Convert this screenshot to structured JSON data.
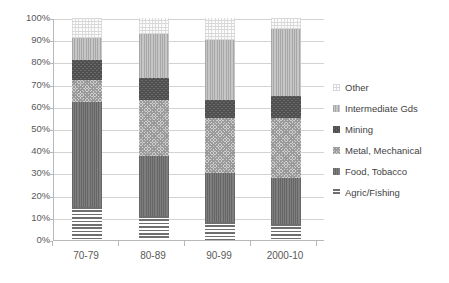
{
  "chart_data": {
    "type": "bar",
    "subtype": "stacked-percent",
    "title": "",
    "xlabel": "",
    "ylabel": "",
    "categories": [
      "70-79",
      "80-89",
      "90-99",
      "2000-10"
    ],
    "ylim": [
      0,
      100
    ],
    "ytick_labels": [
      "0%",
      "10%",
      "20%",
      "30%",
      "40%",
      "50%",
      "60%",
      "70%",
      "80%",
      "90%",
      "100%"
    ],
    "ytick_values": [
      0,
      10,
      20,
      30,
      40,
      50,
      60,
      70,
      80,
      90,
      100
    ],
    "grid": true,
    "legend_position": "right",
    "stack_order_bottom_to_top": [
      "Agric/Fishing",
      "Food, Tobacco",
      "Metal, Mechanical",
      "Mining",
      "Intermediate Gds",
      "Other"
    ],
    "series": [
      {
        "name": "Agric/Fishing",
        "pattern": "horizontal-lines",
        "color": "#6f6f6f",
        "values": [
          15,
          11,
          8,
          7
        ]
      },
      {
        "name": "Food, Tobacco",
        "pattern": "vertical-lines-dark",
        "color": "#757575",
        "values": [
          47,
          27,
          22,
          21
        ]
      },
      {
        "name": "Metal, Mechanical",
        "pattern": "checkerboard-light",
        "color": "#cfcfcf",
        "values": [
          10,
          25,
          25,
          27
        ]
      },
      {
        "name": "Mining",
        "pattern": "checkerboard-dark",
        "color": "#6a6a6a",
        "values": [
          9,
          10,
          8,
          10
        ]
      },
      {
        "name": "Intermediate Gds",
        "pattern": "vertical-lines-light",
        "color": "#bdbdbd",
        "values": [
          10,
          20,
          27,
          30
        ]
      },
      {
        "name": "Other",
        "pattern": "sparse-dots",
        "color": "#fbfbfb",
        "values": [
          9,
          7,
          10,
          5
        ]
      }
    ],
    "cumulative_tops": [
      [
        15,
        62,
        72,
        81,
        91,
        100
      ],
      [
        11,
        38,
        63,
        73,
        93,
        100
      ],
      [
        8,
        30,
        55,
        63,
        90,
        100
      ],
      [
        7,
        28,
        55,
        65,
        95,
        100
      ]
    ]
  },
  "legend": {
    "items": [
      {
        "label": "Other"
      },
      {
        "label": "Intermediate Gds"
      },
      {
        "label": "Mining"
      },
      {
        "label": "Metal, Mechanical"
      },
      {
        "label": "Food, Tobacco"
      },
      {
        "label": "Agric/Fishing"
      }
    ]
  }
}
